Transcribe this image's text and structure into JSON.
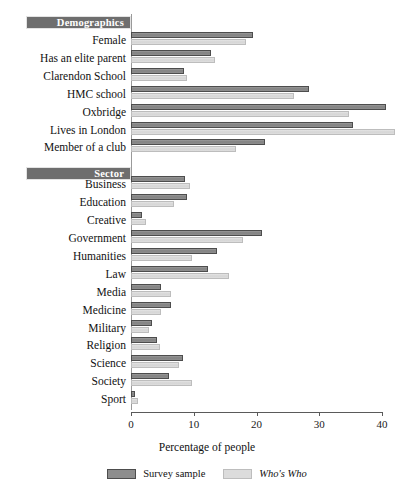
{
  "chart_data": {
    "type": "bar",
    "orientation": "horizontal",
    "title": "",
    "xlabel": "Percentage of people",
    "ylabel": "",
    "xlim": [
      0,
      40
    ],
    "xticks": [
      0,
      10,
      20,
      30,
      40
    ],
    "grid": false,
    "legend_position": "bottom-center",
    "series": [
      {
        "name": "Survey sample",
        "color": "#8d8d8d",
        "values": [
          19.4,
          12.8,
          8.4,
          28.4,
          40.6,
          35.4,
          21.3,
          8.6,
          9.0,
          1.8,
          20.8,
          13.7,
          12.3,
          4.8,
          6.3,
          3.4,
          4.2,
          8.3,
          6.0,
          0.6
        ]
      },
      {
        "name": "Who's Who",
        "color": "#dcdcdc",
        "italic": true,
        "values": [
          18.4,
          13.4,
          9.0,
          26.0,
          34.7,
          42.0,
          16.8,
          9.4,
          6.9,
          2.4,
          17.9,
          9.7,
          15.6,
          6.3,
          4.8,
          2.9,
          4.6,
          7.6,
          9.8,
          1.1
        ]
      }
    ],
    "groups": [
      {
        "header": "Demographics",
        "categories": [
          "Female",
          "Has an elite parent",
          "Clarendon School",
          "HMC school",
          "Oxbridge",
          "Lives in London",
          "Member of a club"
        ]
      },
      {
        "header": "Sector",
        "categories": [
          "Business",
          "Education",
          "Creative",
          "Government",
          "Humanities",
          "Law",
          "Media",
          "Medicine",
          "Military",
          "Religion",
          "Science",
          "Society",
          "Sport"
        ]
      }
    ],
    "categories": [
      "Female",
      "Has an elite parent",
      "Clarendon School",
      "HMC school",
      "Oxbridge",
      "Lives in London",
      "Member of a club",
      "Business",
      "Education",
      "Creative",
      "Government",
      "Humanities",
      "Law",
      "Media",
      "Medicine",
      "Military",
      "Religion",
      "Science",
      "Society",
      "Sport"
    ]
  },
  "legend": {
    "items": [
      {
        "label": "Survey sample",
        "style": "dark"
      },
      {
        "label": "Who's Who",
        "style": "light"
      }
    ]
  },
  "axis": {
    "x_title": "Percentage of people",
    "tick_labels": [
      "0",
      "10",
      "20",
      "30",
      "40"
    ]
  }
}
